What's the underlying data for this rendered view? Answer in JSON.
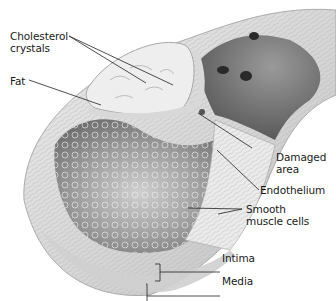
{
  "diagram": {
    "labels": [
      {
        "id": "cholesterol",
        "line1": "Cholesterol",
        "line2": "crystals"
      },
      {
        "id": "fat",
        "line1": "Fat"
      },
      {
        "id": "damaged",
        "line1": "Damaged",
        "line2": "area"
      },
      {
        "id": "endothelium",
        "line1": "Endothelium"
      },
      {
        "id": "smooth",
        "line1": "Smooth",
        "line2": "muscle cells"
      },
      {
        "id": "intima",
        "line1": "Intima"
      },
      {
        "id": "media",
        "line1": "Media"
      }
    ],
    "colors": {
      "background": "#ffffff",
      "wall_light": "#e6e6e6",
      "wall_mid": "#c9c9c9",
      "lumen_dark": "#8a8a8a",
      "plaque": "#efefef",
      "leader_line": "#222222",
      "text": "#1a1a1a"
    }
  }
}
